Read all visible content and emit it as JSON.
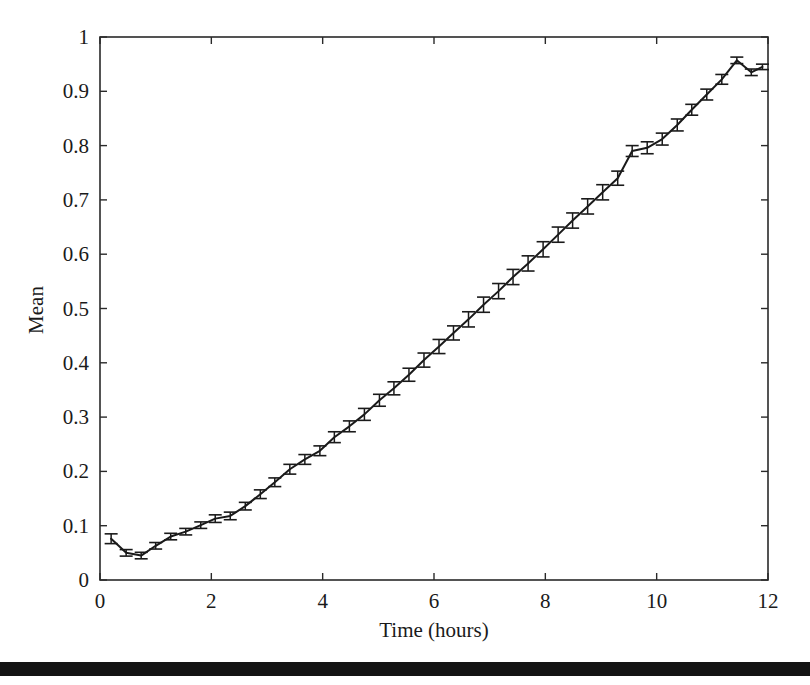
{
  "figure": {
    "name": "mean-vs-time-errorbar-plot",
    "background": "#ffffff",
    "ink_color": "#1a1a1a",
    "scan_artifact": {
      "name": "page-edge-bar",
      "top": 662,
      "height": 14,
      "color": "#141414"
    }
  },
  "plot_box": {
    "left": 100,
    "top": 37,
    "right": 768,
    "bottom": 580,
    "border_color": "#2a2a2a",
    "border_width": 1.6
  },
  "chart_data": {
    "type": "line",
    "title": "",
    "xlabel": "Time (hours)",
    "ylabel": "Mean",
    "xlim": [
      0,
      12
    ],
    "ylim": [
      0,
      1
    ],
    "grid": false,
    "legend": null,
    "xticks": [
      0,
      2,
      4,
      6,
      8,
      10,
      12
    ],
    "xtick_labels": [
      "0",
      "2",
      "4",
      "6",
      "8",
      "10",
      "12"
    ],
    "yticks": [
      0,
      0.1,
      0.2,
      0.3,
      0.4,
      0.5,
      0.6,
      0.7,
      0.8,
      0.9,
      1
    ],
    "ytick_labels": [
      "0",
      "0.1",
      "0.2",
      "0.3",
      "0.4",
      "0.5",
      "0.6",
      "0.7",
      "0.8",
      "0.9",
      "1"
    ],
    "tick_direction": "in",
    "marker": "none",
    "error_bars": "vertical-with-caps",
    "series": [
      {
        "name": "Mean",
        "color": "#1a1a1a",
        "line_width": 2.0,
        "x": [
          0.2,
          0.47,
          0.74,
          1.0,
          1.27,
          1.54,
          1.81,
          2.07,
          2.34,
          2.61,
          2.88,
          3.14,
          3.41,
          3.68,
          3.95,
          4.21,
          4.48,
          4.75,
          5.02,
          5.28,
          5.55,
          5.82,
          6.09,
          6.35,
          6.62,
          6.89,
          7.16,
          7.42,
          7.69,
          7.96,
          8.23,
          8.49,
          8.76,
          9.03,
          9.3,
          9.56,
          9.83,
          10.1,
          10.37,
          10.63,
          10.9,
          11.17,
          11.44,
          11.7,
          11.9
        ],
        "y": [
          0.076,
          0.05,
          0.045,
          0.063,
          0.08,
          0.089,
          0.101,
          0.113,
          0.118,
          0.136,
          0.158,
          0.18,
          0.204,
          0.222,
          0.238,
          0.263,
          0.283,
          0.305,
          0.331,
          0.353,
          0.378,
          0.405,
          0.43,
          0.455,
          0.48,
          0.507,
          0.532,
          0.558,
          0.583,
          0.609,
          0.636,
          0.662,
          0.688,
          0.714,
          0.74,
          0.79,
          0.796,
          0.812,
          0.838,
          0.866,
          0.894,
          0.922,
          0.957,
          0.935,
          0.945
        ],
        "yerr": [
          0.009,
          0.006,
          0.006,
          0.006,
          0.006,
          0.006,
          0.006,
          0.007,
          0.007,
          0.007,
          0.008,
          0.008,
          0.009,
          0.009,
          0.009,
          0.01,
          0.01,
          0.011,
          0.011,
          0.012,
          0.012,
          0.013,
          0.013,
          0.013,
          0.014,
          0.014,
          0.014,
          0.014,
          0.014,
          0.014,
          0.014,
          0.014,
          0.014,
          0.014,
          0.013,
          0.01,
          0.011,
          0.011,
          0.011,
          0.01,
          0.01,
          0.009,
          0.006,
          0.006,
          0.005
        ]
      }
    ]
  },
  "labels": {
    "x_axis_title": "Time (hours)",
    "y_axis_title": "Mean"
  }
}
